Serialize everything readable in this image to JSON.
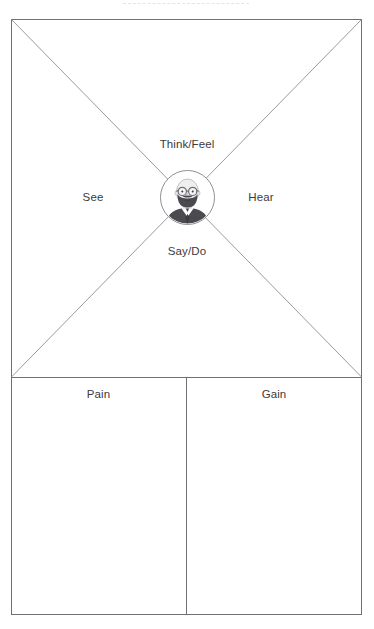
{
  "document": {
    "type": "empathy-map-canvas",
    "title": "Empathy Map"
  },
  "header": {
    "remnant_note": ""
  },
  "quadrants": {
    "think_feel": "Think/Feel",
    "see": "See",
    "hear": "Hear",
    "say_do": "Say/Do"
  },
  "bottom": {
    "pain": "Pain",
    "gain": "Gain"
  },
  "persona": {
    "icon": "bearded-man-avatar",
    "description": "Bald man with round glasses, full beard, collared shirt and tie"
  },
  "colors": {
    "page_background": "#ffffff",
    "frame_stroke": "#6f6f75",
    "diagonal_stroke": "#9a9aa0",
    "divider_stroke": "#6f6f75",
    "avatar_ring": "#8d8d93",
    "avatar_dark": "#4a4a4f",
    "avatar_mid": "#6e6e74",
    "avatar_light": "#d9d9dd",
    "text": "#3b3b40",
    "remnant": "#cfcfd4"
  },
  "geometry": {
    "frame": {
      "x": 11,
      "y": 19,
      "width": 351,
      "height": 596
    },
    "horizontal_divider_y": 377,
    "vertical_divider_x": 186,
    "avatar_center": {
      "x": 186,
      "y": 196
    },
    "avatar_radius": 26
  }
}
